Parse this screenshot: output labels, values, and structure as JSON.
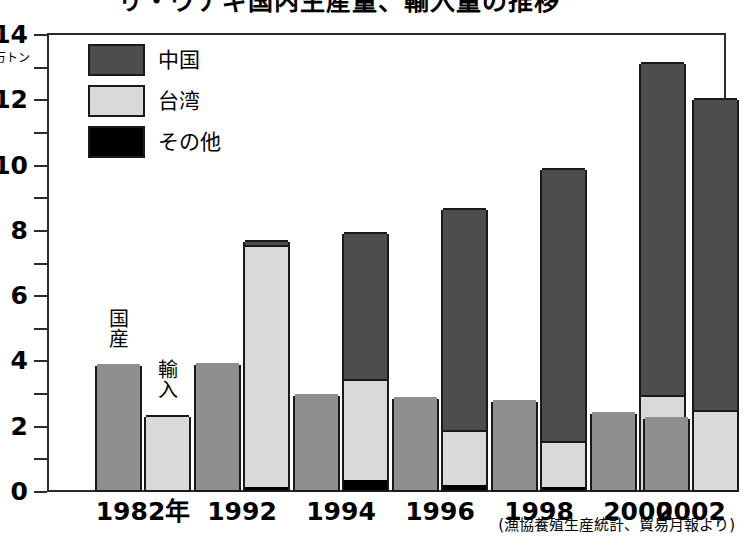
{
  "title": "リ・ウナギ国内生産量、輸入量の推移",
  "source_note": "(漁協養殖生産統計、貿易月報より)",
  "axis": {
    "y_unit": "万トン",
    "y_major_labels": [
      "14",
      "12",
      "10",
      "8",
      "6",
      "4",
      "2",
      "0"
    ],
    "y_major_values": [
      14,
      12,
      10,
      8,
      6,
      4,
      2,
      0
    ],
    "y_minor_values": [
      13,
      11,
      9,
      7,
      5,
      3,
      1
    ],
    "y_min": 0,
    "y_max": 14
  },
  "legend": {
    "items": [
      {
        "label": "中国",
        "color": "#4d4d4d"
      },
      {
        "label": "台湾",
        "color": "#d9d9d9"
      },
      {
        "label": "その他",
        "color": "#000000"
      }
    ]
  },
  "annotations": {
    "domestic": "国産",
    "import": "輸入"
  },
  "colors": {
    "domestic": "#8f8f8f",
    "china": "#4d4d4d",
    "taiwan": "#d9d9d9",
    "other": "#000000",
    "outline": "#1a1a1a",
    "frame": "#2b2b2b",
    "background": "#ffffff"
  },
  "chart_data": {
    "type": "bar",
    "title": "リ・ウナギ国内生産量、輸入量の推移",
    "xlabel": "",
    "ylabel": "万トン",
    "ylim": [
      0,
      14
    ],
    "grid": false,
    "legend_position": "top-left",
    "stacked": true,
    "categories": [
      "1982年",
      "1992",
      "1994",
      "1996",
      "1998",
      "2000",
      "2002"
    ],
    "groups": [
      {
        "category": "1982年",
        "domestic": 3.85,
        "import_total": 2.3,
        "import_segments": {
          "other": 0.0,
          "taiwan": 2.3,
          "china": 0.0
        }
      },
      {
        "category": "1992",
        "domestic": 3.9,
        "import_total": 7.65,
        "import_segments": {
          "other": 0.1,
          "taiwan": 7.4,
          "china": 0.15
        }
      },
      {
        "category": "1994",
        "domestic": 2.95,
        "import_total": 7.9,
        "import_segments": {
          "other": 0.3,
          "taiwan": 3.1,
          "china": 4.5
        }
      },
      {
        "category": "1996",
        "domestic": 2.85,
        "import_total": 8.65,
        "import_segments": {
          "other": 0.15,
          "taiwan": 1.7,
          "china": 6.8
        }
      },
      {
        "category": "1998",
        "domestic": 2.75,
        "import_total": 9.85,
        "import_segments": {
          "other": 0.1,
          "taiwan": 1.4,
          "china": 8.35
        }
      },
      {
        "category": "2000",
        "domestic": 2.4,
        "import_total": 13.1,
        "import_segments": {
          "other": 0.0,
          "taiwan": 2.9,
          "china": 10.2
        }
      },
      {
        "category": "2002",
        "domestic": 2.25,
        "import_total": 12.0,
        "import_segments": {
          "other": 0.0,
          "taiwan": 2.45,
          "china": 9.55
        }
      }
    ],
    "series": [
      {
        "name": "国産",
        "values": [
          3.85,
          3.9,
          2.95,
          2.85,
          2.75,
          2.4,
          2.25
        ]
      },
      {
        "name": "その他",
        "values": [
          0.0,
          0.1,
          0.3,
          0.15,
          0.1,
          0.0,
          0.0
        ]
      },
      {
        "name": "台湾",
        "values": [
          2.3,
          7.4,
          3.1,
          1.7,
          1.4,
          2.9,
          2.45
        ]
      },
      {
        "name": "中国",
        "values": [
          0.0,
          0.15,
          4.5,
          6.8,
          8.35,
          10.2,
          9.55
        ]
      }
    ]
  }
}
